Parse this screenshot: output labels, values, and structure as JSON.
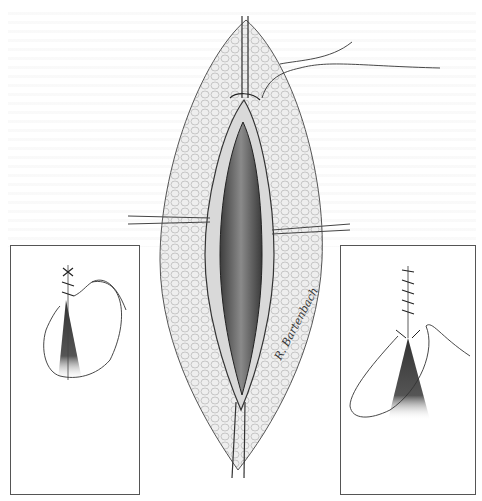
{
  "figure": {
    "type": "surgical-illustration",
    "main_panel": {
      "retractors": [
        "top",
        "bottom",
        "left",
        "right"
      ],
      "suture_visible": true
    },
    "inset_left": {
      "content": "apex suture with needle loop"
    },
    "inset_right": {
      "content": "running closure with needle loop"
    },
    "signature": "R. Bartenbach"
  },
  "colors": {
    "background": "#ffffff",
    "line": "#333333",
    "tissue_fill": "#e6e6e6",
    "cavity_dark": "#5a5a5a",
    "inset_border": "#555555"
  }
}
